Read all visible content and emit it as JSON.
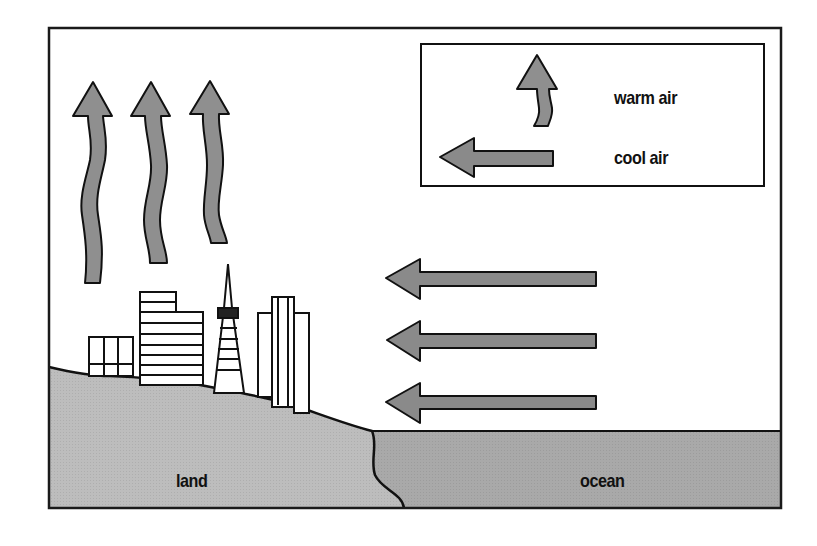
{
  "diagram": {
    "colors": {
      "frame": "#1a1a1a",
      "background": "#ffffff",
      "land": "#bdbdbd",
      "ocean": "#a9a9a9",
      "warm_arrow": "#8f8f8f",
      "cool_arrow": "#8a8a8a",
      "outline": "#111111"
    },
    "legend": {
      "items": [
        {
          "icon": "wavy-up-arrow-icon",
          "label": "warm air"
        },
        {
          "icon": "left-arrow-icon",
          "label": "cool air"
        }
      ]
    },
    "regions": {
      "land": {
        "label": "land"
      },
      "ocean": {
        "label": "ocean"
      }
    },
    "warm_air_arrows": 3,
    "cool_air_arrows": 3,
    "buildings": [
      "low-rise block",
      "stepped office tower",
      "pyramid tower",
      "tall twin-column tower"
    ]
  }
}
